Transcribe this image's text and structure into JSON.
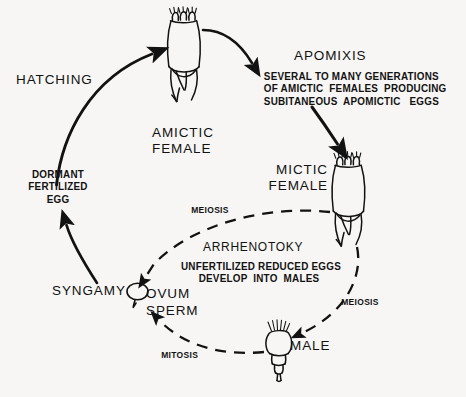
{
  "diagram": {
    "background_color": "#f7f6f4",
    "ink_color": "#121212"
  },
  "labels": {
    "hatching": "HATCHING",
    "amictic_female": "AMICTIC\nFEMALE",
    "apomixis_heading": "APOMIXIS",
    "apomixis_body": "SEVERAL TO MANY GENERATIONS\nOF AMICTIC  FEMALES  PRODUCING\nSUBITANEOUS  APOMICTIC   EGGS",
    "mictic_female": "MICTIC\nFEMALE",
    "dormant_egg": "DORMANT\nFERTILIZED\nEGG",
    "meiosis_upper": "MEIOSIS",
    "meiosis_lower": "MEIOSIS",
    "arrhenotoky_heading": "ARRHENOTOKY",
    "arrhenotoky_body": "UNFERTILIZED REDUCED EGGS\nDEVELOP  INTO  MALES",
    "syngamy": "SYNGAMY",
    "ovum": "OVUM",
    "sperm": "SPERM",
    "mitosis": "MITOSIS",
    "male": "MALE"
  },
  "figures": {
    "amictic_female_icon": "rotifer-female",
    "mictic_female_icon": "rotifer-female",
    "male_icon": "rotifer-male",
    "ovum_icon": "ovum-ellipse",
    "sperm_icon": "sperm-tick"
  },
  "arrows": {
    "hatching_arrow": "solid-curve-up-right",
    "apomixis_arrow": "solid-curve-right",
    "to_mictic_arrow": "solid-diagonal-down-right",
    "syngamy_arrow": "solid-curve-up",
    "meiosis_to_ovum_arrow": "dashed-curve-left-down",
    "meiosis_to_male_arrow": "dashed-curve-down-left",
    "mitosis_arrow": "dashed-curve-left-up"
  }
}
